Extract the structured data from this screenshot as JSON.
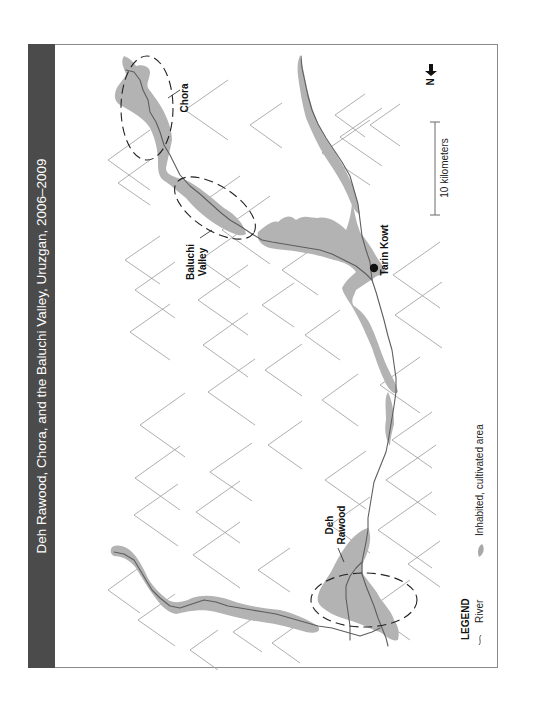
{
  "title": "Deh Rawood, Chora, and the Baluchi Valley, Uruzgan, 2006–2009",
  "orientation": "rotated-90-ccw",
  "places": [
    {
      "name": "Chora",
      "type": "district-label",
      "encircled": true
    },
    {
      "name": "Baluchi Valley",
      "lines": [
        "Baluchi",
        "Valley"
      ],
      "type": "valley-label",
      "encircled": true
    },
    {
      "name": "Tarin Kowt",
      "type": "town",
      "marker": "black-dot"
    },
    {
      "name": "Deh Rawood",
      "lines": [
        "Deh",
        "Rawood"
      ],
      "type": "district-label",
      "encircled": true
    }
  ],
  "labels": {
    "chora": "Chora",
    "baluchi_line1": "Baluchi",
    "baluchi_line2": "Valley",
    "tarin_kowt": "Tarin Kowt",
    "deh_line1": "Deh",
    "deh_line2": "Rawood"
  },
  "north_arrow": {
    "label": "N",
    "icon": "arrow-icon"
  },
  "scale_bar": {
    "label": "10 kilometers",
    "length_km": 10
  },
  "legend": {
    "title": "LEGEND",
    "items": [
      {
        "symbol": "river-line-icon",
        "label": "River"
      },
      {
        "symbol": "cultivated-area-swatch",
        "label": "Inhabited, cultivated area"
      }
    ]
  },
  "colors": {
    "title_bar": "#4b4b4b",
    "title_text": "#ffffff",
    "cultivated_area": "#b3b3b3",
    "river": "#5e5e5e",
    "mountain_symbol": "#9a9a9a",
    "frame_border": "#8a8a8a"
  }
}
